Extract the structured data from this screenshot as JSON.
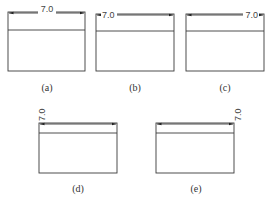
{
  "figure": {
    "panels": [
      {
        "id": "a",
        "caption": "(a)",
        "dimension": "7.0",
        "text_position": "center"
      },
      {
        "id": "b",
        "caption": "(b)",
        "dimension": "7.0",
        "text_position": "left"
      },
      {
        "id": "c",
        "caption": "(c)",
        "dimension": "7.0",
        "text_position": "right"
      },
      {
        "id": "d",
        "caption": "(d)",
        "dimension": "7.0",
        "text_position": "left-rotated"
      },
      {
        "id": "e",
        "caption": "(e)",
        "dimension": "7.0",
        "text_position": "right-rotated"
      }
    ]
  },
  "colors": {
    "line": "#3a3a3a",
    "text": "#444444"
  }
}
